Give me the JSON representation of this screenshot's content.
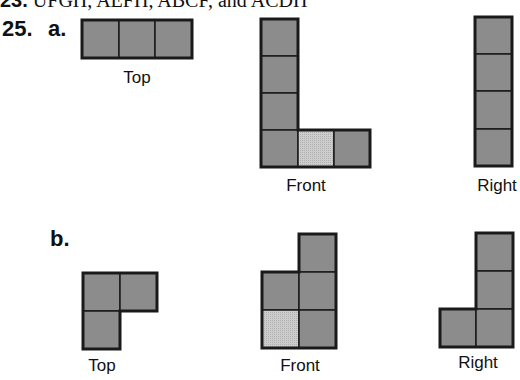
{
  "cutoff_line": {
    "number": "23.",
    "text": "UFGH, AEFH, ABCF, and ACDH"
  },
  "problem": {
    "number": "25."
  },
  "parts": [
    {
      "label": "a.",
      "views": [
        {
          "name": "Top",
          "label": "Top"
        },
        {
          "name": "Front",
          "label": "Front"
        },
        {
          "name": "Right",
          "label": "Right"
        }
      ]
    },
    {
      "label": "b.",
      "views": [
        {
          "name": "Top",
          "label": "Top"
        },
        {
          "name": "Front",
          "label": "Front"
        },
        {
          "name": "Right",
          "label": "Right"
        }
      ]
    }
  ],
  "colors": {
    "cell_dark": "#8c8c8c",
    "cell_light": "#c9c9c9",
    "outline": "#1a1a1a"
  }
}
